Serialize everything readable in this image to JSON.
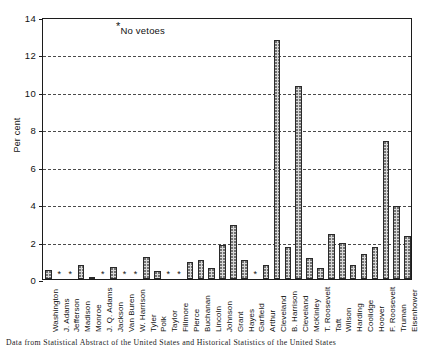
{
  "chart_data": {
    "type": "bar",
    "title": "",
    "xlabel": "",
    "ylabel": "Per cent",
    "ylim": [
      0,
      14
    ],
    "ytick_values": [
      0,
      2,
      4,
      6,
      8,
      10,
      12,
      14
    ],
    "ytick_labels": [
      "0",
      "2",
      "4",
      "6",
      "8",
      "10",
      "12",
      "14"
    ],
    "grid": true,
    "grid_axis": "y",
    "legend": false,
    "annotation": "No vetoes",
    "annotation_marker": "*",
    "no_veto_marker": "*",
    "categories": [
      "Washington",
      "J. Adams",
      "Jefferson",
      "Madison",
      "Monroe",
      "J. Q. Adams",
      "Jackson",
      "Van Buren",
      "W. Harrison",
      "Tyler",
      "Polk",
      "Taylor",
      "Fillmore",
      "Pierce",
      "Buchanan",
      "Lincoln",
      "Johnson",
      "Grant",
      "Hayes",
      "Garfield",
      "Arthur",
      "Cleveland",
      "B. Harrison",
      "Cleveland",
      "McKinley",
      "T. Roosevelt",
      "Taft",
      "Wilson",
      "Harding",
      "Coolidge",
      "Hoover",
      "F. Roosevelt",
      "Truman",
      "Eisenhower"
    ],
    "values": [
      0.5,
      null,
      null,
      0.75,
      0.12,
      null,
      0.65,
      null,
      null,
      1.2,
      0.45,
      null,
      null,
      0.9,
      1.0,
      0.6,
      1.8,
      2.9,
      1.0,
      null,
      0.75,
      12.75,
      1.7,
      10.3,
      1.1,
      0.6,
      2.4,
      1.95,
      0.75,
      1.35,
      1.7,
      7.4,
      3.9,
      2.3
    ],
    "null_means": "no vetoes (marked with asterisk)"
  },
  "caption": "Data from Statistical Abstract of the United States and Historical Statistics of the United States",
  "colors": {
    "bar_fill": "#d8d8d8",
    "bar_edge": "#2a2a2a",
    "axis": "#1c1c1c",
    "grid": "#4a4a4a",
    "text": "#111111"
  }
}
